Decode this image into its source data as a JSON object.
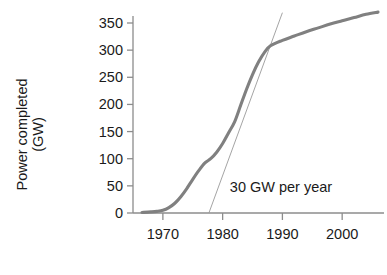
{
  "chart_data": {
    "type": "line",
    "title": "",
    "xlabel": "",
    "ylabel_line1": "Power completed",
    "ylabel_line2": "(GW)",
    "xlim": [
      1965.0,
      2007.0
    ],
    "ylim": [
      0,
      385
    ],
    "grid": false,
    "legend": "none",
    "curve_color": "#808080",
    "tangent_color": "#9a9a9a",
    "axis_color": "#8c8c8c",
    "text_color": "#1a1a1a",
    "xticks": [
      1970,
      1980,
      1990,
      2000
    ],
    "xtick_labels": [
      "1970",
      "1980",
      "1990",
      "2000"
    ],
    "yticks": [
      0,
      50,
      100,
      150,
      200,
      250,
      300,
      350
    ],
    "ytick_labels": [
      "0",
      "50",
      "100",
      "150",
      "200",
      "250",
      "300",
      "350"
    ],
    "annotations": [
      {
        "text": "30 GW per year",
        "x": 1981.2,
        "y": 38,
        "name": "slope-annotation"
      }
    ],
    "tangent_line": {
      "name": "30-gw-per-year-tangent",
      "slope_gw_per_year": 30,
      "x_intercept_year": 1977.7,
      "x_start": 1977.7,
      "y_start": 0,
      "x_end": 1990.0,
      "y_end": 369
    },
    "series": [
      {
        "name": "Nuclear power capacity completed cumulative",
        "x": [
          1966.5,
          1968,
          1969,
          1970,
          1971,
          1972,
          1973,
          1974,
          1975,
          1976,
          1977,
          1978,
          1979,
          1980,
          1981,
          1982,
          1983,
          1984,
          1985,
          1986,
          1987,
          1988,
          1990,
          1992,
          1994,
          1996,
          1998,
          2000,
          2002,
          2004,
          2006
        ],
        "y": [
          1,
          2,
          3,
          5,
          10,
          18,
          30,
          45,
          62,
          78,
          92,
          100,
          112,
          128,
          148,
          168,
          198,
          228,
          255,
          278,
          296,
          308,
          318,
          326,
          334,
          341,
          348,
          354,
          360,
          366,
          370
        ]
      }
    ]
  }
}
